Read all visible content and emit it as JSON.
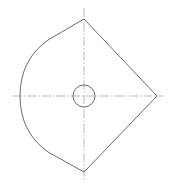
{
  "drawing": {
    "type": "technical-part-outline",
    "canvas": {
      "width": 173,
      "height": 187
    },
    "colors": {
      "outline": "#5a5a5a",
      "centerline": "#8a8a8a",
      "background": "#ffffff"
    },
    "profile": {
      "top_vertex": [
        84,
        19
      ],
      "right_vertex": [
        157,
        96
      ],
      "bottom_vertex": [
        84,
        172
      ],
      "left_arc_apex": [
        20,
        96
      ],
      "upper_tangent_point": [
        48,
        40
      ],
      "lower_tangent_point": [
        48,
        152
      ]
    },
    "hole": {
      "center": [
        84,
        96
      ],
      "radius": 11
    },
    "centerlines": {
      "horizontal": {
        "x1": 13,
        "x2": 163,
        "y": 96
      },
      "vertical": {
        "x": 84,
        "y1": 8,
        "y2": 181
      }
    }
  }
}
